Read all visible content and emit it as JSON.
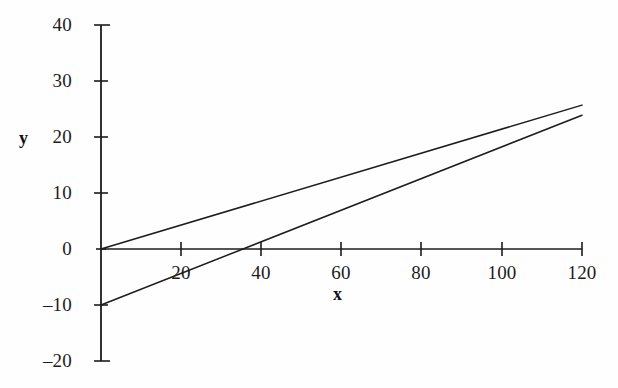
{
  "figure": {
    "background_color": "#fefefe",
    "ink_color": "#1c1c1c",
    "width": 618,
    "height": 388
  },
  "axes": {
    "x_title": "x",
    "y_title": "y",
    "x_ticks": [
      "20",
      "40",
      "60",
      "80",
      "100",
      "120"
    ],
    "y_ticks": [
      "40",
      "30",
      "20",
      "10",
      "0",
      "–10",
      "–20"
    ]
  },
  "chart_data": {
    "type": "line",
    "title": "",
    "subtitle": "",
    "xlabel": "x",
    "ylabel": "y",
    "xlim": [
      0,
      120
    ],
    "ylim": [
      -20,
      40
    ],
    "xticks": [
      20,
      40,
      60,
      80,
      100,
      120
    ],
    "yticks": [
      -20,
      -10,
      0,
      10,
      20,
      30,
      40
    ],
    "xtick_labels": [
      "20",
      "40",
      "60",
      "80",
      "100",
      "120"
    ],
    "ytick_labels": [
      "–20",
      "–10",
      "0",
      "10",
      "20",
      "30",
      "40"
    ],
    "grid": false,
    "legend": null,
    "legend_position": "none",
    "annotations": [],
    "series": [
      {
        "name": "line-1",
        "kind": "straight-line",
        "intercept": 0.0,
        "slope": 0.214,
        "x": [
          0,
          120
        ],
        "values": [
          0.0,
          25.7
        ],
        "x_axis_crossing": 0,
        "color": "#1c1c1c"
      },
      {
        "name": "line-2",
        "kind": "straight-line",
        "intercept": -10.0,
        "slope": 0.282,
        "x": [
          0,
          120
        ],
        "values": [
          -10.0,
          23.9
        ],
        "x_axis_crossing": 35.5,
        "color": "#1c1c1c"
      }
    ],
    "intersection": {
      "x": 100,
      "y": 21.4
    }
  }
}
